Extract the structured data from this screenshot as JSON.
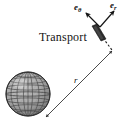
{
  "figure": {
    "background_color": "#ffffff",
    "ink_color": "#141414",
    "labels": {
      "transport": "Transport",
      "unit_vector_theta_base": "e",
      "unit_vector_theta_sub": "θ",
      "unit_vector_r_base": "e",
      "unit_vector_r_sub": "r",
      "radius": "r"
    },
    "elements": {
      "globe_name": "shaded-grid-sphere",
      "slab_name": "transported-vector-slab",
      "dimension_line_name": "radius-dimension-line",
      "dashed_line_name": "dashed-connector",
      "theta_arrow_name": "e-theta-arrow",
      "r_arrow_name": "e-r-arrow"
    },
    "geometry": {
      "globe_center_x": 28,
      "globe_center_y": 94,
      "globe_radius": 22,
      "vector_origin_x": 100,
      "vector_origin_y": 27,
      "radius_line_from_x": 46,
      "radius_line_from_y": 117,
      "radius_line_to_x": 112,
      "radius_line_to_y": 51
    }
  }
}
